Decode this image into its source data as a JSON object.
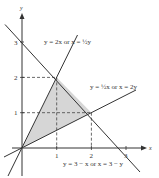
{
  "figure": {
    "axes": {
      "x_label": "x",
      "y_label": "y"
    },
    "x_ticks": [
      "1",
      "2",
      "3"
    ],
    "y_ticks": [
      "1",
      "2",
      "3"
    ],
    "lines": [
      {
        "id": "line-2x",
        "label": "y = 2x  or  x = ½y"
      },
      {
        "id": "line-half-x",
        "label": "y = ½x  or  x = 2y"
      },
      {
        "id": "line-3-minus-x",
        "label": "y = 3 − x  or  x = 3 − y"
      }
    ],
    "shaded_region": {
      "vertices": [
        [
          0,
          0
        ],
        [
          1,
          2
        ],
        [
          2,
          1
        ]
      ],
      "color": "#d6d6d6"
    },
    "colors": {
      "line": "#333333",
      "shade": "#d6d6d6",
      "dash": "#444444"
    }
  }
}
